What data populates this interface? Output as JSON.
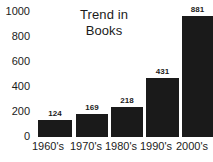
{
  "chart_data": {
    "type": "bar",
    "title": "Trend in\nBooks",
    "title_lines": [
      "Trend in",
      "Books"
    ],
    "xlabel": "",
    "ylabel": "",
    "categories": [
      "1960's",
      "1970's",
      "1980's",
      "1990's",
      "2000's"
    ],
    "values": [
      124,
      169,
      218,
      431,
      881
    ],
    "value_labels": [
      "124",
      "169",
      "218",
      "431",
      "881"
    ],
    "ylim": [
      0,
      1000
    ],
    "yticks": [
      1000,
      800,
      600,
      400,
      200,
      0
    ],
    "ytick_labels": [
      "1000",
      "800",
      "600",
      "400",
      "200",
      "0"
    ],
    "grid": false,
    "legend": null,
    "bar_color": "#1a1a1a",
    "background_color": "#ffffff",
    "text_color": "#1b1b1b"
  }
}
